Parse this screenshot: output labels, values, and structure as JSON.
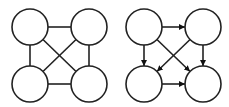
{
  "diagram": {
    "stroke_color": "#222222",
    "fill_color": "#ffffff",
    "graphs": [
      {
        "name": "undirected-graph",
        "directed": false,
        "nodes": [
          {
            "id": "A",
            "position": "top-left",
            "cx": 30,
            "cy": 27,
            "r": 18
          },
          {
            "id": "B",
            "position": "top-right",
            "cx": 89,
            "cy": 27,
            "r": 18
          },
          {
            "id": "C",
            "position": "bottom-left",
            "cx": 30,
            "cy": 84,
            "r": 18
          },
          {
            "id": "D",
            "position": "bottom-right",
            "cx": 89,
            "cy": 84,
            "r": 18
          }
        ],
        "edges": [
          {
            "from": "A",
            "to": "B"
          },
          {
            "from": "A",
            "to": "C"
          },
          {
            "from": "B",
            "to": "D"
          },
          {
            "from": "C",
            "to": "D"
          },
          {
            "from": "A",
            "to": "D"
          },
          {
            "from": "B",
            "to": "C"
          }
        ]
      },
      {
        "name": "directed-graph",
        "directed": true,
        "nodes": [
          {
            "id": "A",
            "position": "top-left",
            "cx": 144,
            "cy": 27,
            "r": 18
          },
          {
            "id": "B",
            "position": "top-right",
            "cx": 203,
            "cy": 27,
            "r": 18
          },
          {
            "id": "C",
            "position": "bottom-left",
            "cx": 144,
            "cy": 84,
            "r": 18
          },
          {
            "id": "D",
            "position": "bottom-right",
            "cx": 203,
            "cy": 84,
            "r": 18
          }
        ],
        "edges": [
          {
            "from": "A",
            "to": "B"
          },
          {
            "from": "A",
            "to": "C"
          },
          {
            "from": "B",
            "to": "D"
          },
          {
            "from": "C",
            "to": "D"
          },
          {
            "from": "A",
            "to": "D"
          },
          {
            "from": "B",
            "to": "C"
          }
        ]
      }
    ]
  }
}
